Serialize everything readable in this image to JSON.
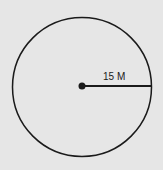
{
  "diagram": {
    "shape": "circle",
    "radius_label": "15 M",
    "colors": {
      "background": "#e6e6e6",
      "stroke": "#1a1a1a"
    }
  }
}
